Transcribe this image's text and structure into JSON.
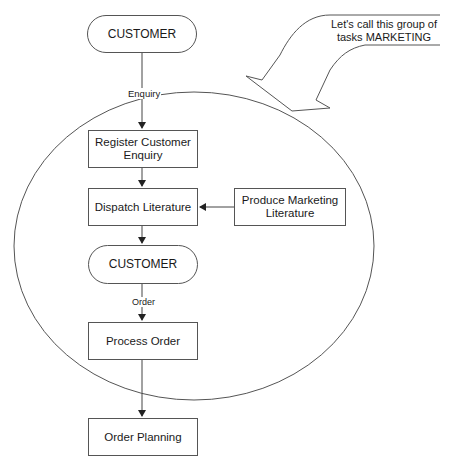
{
  "diagram": {
    "type": "flowchart",
    "nodes": [
      {
        "id": "customer_top",
        "shape": "terminator",
        "label": "CUSTOMER"
      },
      {
        "id": "register_enquiry",
        "shape": "process",
        "label": "Register Customer Enquiry"
      },
      {
        "id": "dispatch_literature",
        "shape": "process",
        "label": "Dispatch Literature"
      },
      {
        "id": "produce_literature",
        "shape": "process",
        "label": "Produce Marketing Literature"
      },
      {
        "id": "customer_mid",
        "shape": "terminator",
        "label": "CUSTOMER"
      },
      {
        "id": "process_order",
        "shape": "process",
        "label": "Process Order"
      },
      {
        "id": "order_planning",
        "shape": "process",
        "label": "Order Planning"
      }
    ],
    "edges": [
      {
        "from": "customer_top",
        "to": "register_enquiry",
        "label": "Enquiry"
      },
      {
        "from": "register_enquiry",
        "to": "dispatch_literature",
        "label": ""
      },
      {
        "from": "produce_literature",
        "to": "dispatch_literature",
        "label": ""
      },
      {
        "from": "dispatch_literature",
        "to": "customer_mid",
        "label": ""
      },
      {
        "from": "customer_mid",
        "to": "process_order",
        "label": "Order"
      },
      {
        "from": "process_order",
        "to": "order_planning",
        "label": ""
      }
    ],
    "group": {
      "name": "MARKETING",
      "shape": "ellipse",
      "members": [
        "register_enquiry",
        "dispatch_literature",
        "produce_literature",
        "customer_mid",
        "process_order"
      ]
    },
    "callout": {
      "line1": "Let's call this group of",
      "line2": "tasks MARKETING"
    }
  },
  "labels": {
    "customer_top": "CUSTOMER",
    "register_line1": "Register Customer",
    "register_line2": "Enquiry",
    "dispatch": "Dispatch Literature",
    "produce_line1": "Produce Marketing",
    "produce_line2": "Literature",
    "customer_mid": "CUSTOMER",
    "process_order": "Process Order",
    "order_planning": "Order Planning",
    "edge_enquiry": "Enquiry",
    "edge_order": "Order"
  },
  "colors": {
    "stroke": "#555555",
    "background": "#ffffff",
    "text": "#1a1a1a"
  }
}
